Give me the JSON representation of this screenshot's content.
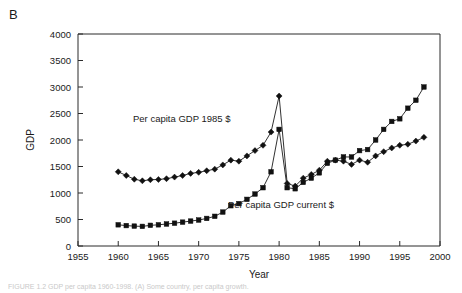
{
  "panel": {
    "label": "B"
  },
  "caption": {
    "text": "FIGURE 1.2   GDP per capita 1960-1998. (A) Some country, per capita growth."
  },
  "chart_data": {
    "type": "line",
    "title": "",
    "xlabel": "Year",
    "ylabel": "GDP",
    "xlim": [
      1955,
      2000
    ],
    "ylim": [
      0,
      4000
    ],
    "xticks": [
      1955,
      1960,
      1965,
      1970,
      1975,
      1980,
      1985,
      1990,
      1995,
      2000
    ],
    "yticks": [
      0,
      500,
      1000,
      1500,
      2000,
      2500,
      3000,
      3500,
      4000
    ],
    "grid": false,
    "legend_position": "inline-annotations",
    "x": [
      1960,
      1961,
      1962,
      1963,
      1964,
      1965,
      1966,
      1967,
      1968,
      1969,
      1970,
      1971,
      1972,
      1973,
      1974,
      1975,
      1976,
      1977,
      1978,
      1979,
      1980,
      1981,
      1982,
      1983,
      1984,
      1985,
      1986,
      1987,
      1988,
      1989,
      1990,
      1991,
      1992,
      1993,
      1994,
      1995,
      1996,
      1997,
      1998
    ],
    "series": [
      {
        "name": "Per capita GDP 1985 $",
        "marker": "diamond",
        "annotation": "Per capita GDP 1985 $",
        "values": [
          1400,
          1330,
          1260,
          1230,
          1250,
          1255,
          1270,
          1300,
          1330,
          1370,
          1390,
          1420,
          1450,
          1530,
          1620,
          1600,
          1700,
          1800,
          1900,
          2150,
          2830,
          1180,
          1130,
          1280,
          1350,
          1430,
          1600,
          1620,
          1600,
          1540,
          1620,
          1580,
          1700,
          1780,
          1850,
          1900,
          1920,
          1980,
          2050
        ]
      },
      {
        "name": "Per capita GDP current $",
        "marker": "square",
        "annotation": "Per capita GDP current $",
        "values": [
          400,
          385,
          375,
          370,
          390,
          400,
          415,
          430,
          450,
          470,
          490,
          520,
          560,
          640,
          760,
          800,
          880,
          980,
          1100,
          1400,
          2200,
          1100,
          1080,
          1200,
          1280,
          1380,
          1560,
          1620,
          1680,
          1680,
          1800,
          1820,
          2000,
          2200,
          2350,
          2400,
          2600,
          2750,
          3000
        ]
      }
    ]
  }
}
